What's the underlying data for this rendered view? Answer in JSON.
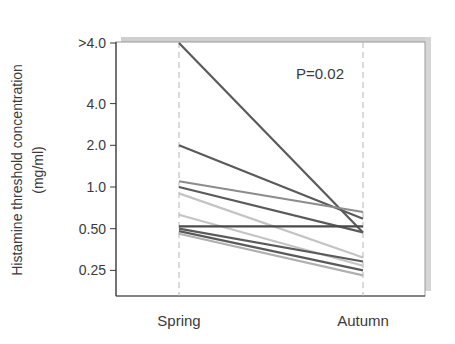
{
  "chart_data": {
    "type": "line",
    "title": "",
    "xlabel": "",
    "ylabel": [
      "Histamine threshold concentration",
      "(mg/ml)"
    ],
    "y_scale": "log2",
    "categories": [
      "Spring",
      "Autumn"
    ],
    "y_ticks": [
      {
        "label": ">4.0",
        "value": 8.0
      },
      {
        "label": "4.0",
        "value": 4.0
      },
      {
        "label": "2.0",
        "value": 2.0
      },
      {
        "label": "1.0",
        "value": 1.0
      },
      {
        "label": "0.50",
        "value": 0.5
      },
      {
        "label": "0.25",
        "value": 0.25
      }
    ],
    "ylim": [
      0.155,
      8.4
    ],
    "grid": false,
    "legend": null,
    "annotations": [
      {
        "text": "P=0.02",
        "position": "top-right"
      }
    ],
    "series": [
      {
        "name": "subject-1",
        "values": [
          8.0,
          0.47
        ],
        "color": "#5a5a5a"
      },
      {
        "name": "subject-2",
        "values": [
          2.0,
          0.59
        ],
        "color": "#5a5a5a"
      },
      {
        "name": "subject-3",
        "values": [
          1.1,
          0.66
        ],
        "color": "#8c8c8c"
      },
      {
        "name": "subject-4",
        "values": [
          1.0,
          0.47
        ],
        "color": "#5a5a5a"
      },
      {
        "name": "subject-5",
        "values": [
          0.9,
          0.31
        ],
        "color": "#c4c4c4"
      },
      {
        "name": "subject-6",
        "values": [
          0.63,
          0.27
        ],
        "color": "#c4c4c4"
      },
      {
        "name": "subject-7",
        "values": [
          0.52,
          0.52
        ],
        "color": "#4a4a4a"
      },
      {
        "name": "subject-8",
        "values": [
          0.5,
          0.29
        ],
        "color": "#5a5a5a"
      },
      {
        "name": "subject-9",
        "values": [
          0.48,
          0.25
        ],
        "color": "#5a5a5a"
      },
      {
        "name": "subject-10",
        "values": [
          0.46,
          0.23
        ],
        "color": "#b0b0b0"
      }
    ]
  },
  "labels": {
    "ylabel_line1": "Histamine threshold concentration",
    "ylabel_line2": "(mg/ml)",
    "annotation": "P=0.02",
    "cat_spring": "Spring",
    "cat_autumn": "Autumn"
  }
}
